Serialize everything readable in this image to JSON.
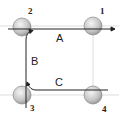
{
  "diagram": {
    "balls": [
      {
        "id": "1",
        "label": "1",
        "cx": 93,
        "cy": 26
      },
      {
        "id": "2",
        "label": "2",
        "cx": 22,
        "cy": 27
      },
      {
        "id": "3",
        "label": "3",
        "cx": 22,
        "cy": 95
      },
      {
        "id": "4",
        "label": "4",
        "cx": 93,
        "cy": 95
      }
    ],
    "paths": [
      {
        "id": "A",
        "label": "A"
      },
      {
        "id": "B",
        "label": "B"
      },
      {
        "id": "C",
        "label": "C"
      }
    ],
    "colors": {
      "line": "#222222",
      "ball_fill": "#c8c8c8",
      "ball_stroke": "#888888",
      "guide": "#dddddd"
    }
  }
}
